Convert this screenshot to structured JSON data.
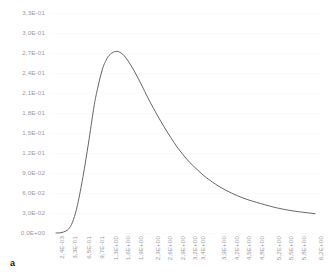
{
  "panel": {
    "label": "a"
  },
  "colors": {
    "background": "#ffffff",
    "curve": "#555558",
    "gridline": "#fbfbfc",
    "tick_text": "#9a9aa2",
    "panel_label": "#1b1b1b"
  },
  "chart_data": {
    "type": "line",
    "title": "",
    "subtitle": "",
    "xlabel": "",
    "ylabel": "",
    "grid": true,
    "legend": null,
    "annotations": [
      "a"
    ],
    "xlim": [
      0.0024,
      6.2
    ],
    "ylim": [
      0.0,
      0.33
    ],
    "y_tick_labels": [
      "0,0E+00",
      "3,0E-02",
      "6,0E-02",
      "9,0E-02",
      "1,2E-01",
      "1,5E-01",
      "1,8E-01",
      "2,1E-01",
      "2,4E-01",
      "2,7E-01",
      "3,0E-01",
      "3,3E-01"
    ],
    "y_tick_values": [
      0.0,
      0.03,
      0.06,
      0.09,
      0.12,
      0.15,
      0.18,
      0.21,
      0.24,
      0.27,
      0.3,
      0.33
    ],
    "x_tick_labels": [
      "2,4E-03",
      "3,3E-01",
      "6,5E-01",
      "9,7E-01",
      "1,3E+00",
      "1,6E+00",
      "1,9E+00",
      "2,3E+00",
      "2,6E+00",
      "2,9E+00",
      "3,2E+00",
      "3,4E+00",
      "3,9E+00",
      "4,2E+00",
      "4,5E+00",
      "4,8E+00",
      "5,2E+00",
      "5,5E+00",
      "5,8E+00",
      "6,2E+00"
    ],
    "x_tick_values": [
      0.0024,
      0.33,
      0.65,
      0.97,
      1.3,
      1.6,
      1.9,
      2.3,
      2.6,
      2.9,
      3.2,
      3.4,
      3.9,
      4.2,
      4.5,
      4.8,
      5.2,
      5.5,
      5.8,
      6.2
    ],
    "series": [
      {
        "name": "distribution",
        "x": [
          0.0024,
          0.12,
          0.24,
          0.33,
          0.42,
          0.52,
          0.65,
          0.78,
          0.9,
          0.97,
          1.1,
          1.2,
          1.3,
          1.45,
          1.6,
          1.75,
          1.9,
          2.05,
          2.2,
          2.3,
          2.45,
          2.6,
          2.75,
          2.9,
          3.05,
          3.2,
          3.4,
          3.6,
          3.9,
          4.2,
          4.5,
          4.8,
          5.2,
          5.5,
          5.8,
          6.2
        ],
        "y": [
          0.0,
          0.0005,
          0.003,
          0.008,
          0.02,
          0.043,
          0.085,
          0.135,
          0.185,
          0.209,
          0.243,
          0.259,
          0.268,
          0.2725,
          0.268,
          0.256,
          0.24,
          0.222,
          0.203,
          0.191,
          0.174,
          0.158,
          0.143,
          0.129,
          0.117,
          0.106,
          0.094,
          0.083,
          0.07,
          0.06,
          0.052,
          0.046,
          0.039,
          0.035,
          0.032,
          0.029
        ]
      }
    ],
    "peak": {
      "x": 1.45,
      "y": 0.2725
    }
  }
}
